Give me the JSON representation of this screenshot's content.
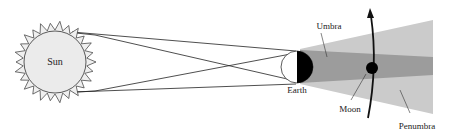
{
  "diagram": {
    "type": "lunar-eclipse-geometry",
    "labels": {
      "sun": "Sun",
      "earth": "Earth",
      "moon": "Moon",
      "umbra": "Umbra",
      "penumbra": "Penumbra"
    },
    "colors": {
      "sun_fill": "#ececec",
      "penumbra": "#c9c9c9",
      "umbra": "#9a9a9a",
      "earth_night": "#000000",
      "moon": "#000000",
      "lines": "#222222"
    }
  }
}
